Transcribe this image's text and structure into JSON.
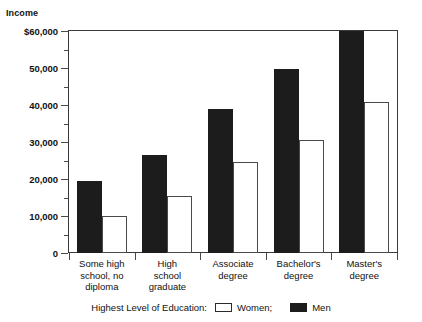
{
  "chart_data": {
    "type": "bar",
    "title": "",
    "xlabel": "Highest Level of Education",
    "ylabel": "Income",
    "ylim": [
      0,
      60000
    ],
    "ytick_labels": [
      "$60,000",
      "50,000",
      "40,000",
      "30,000",
      "20,000",
      "10,000",
      "0"
    ],
    "ytick_values": [
      60000,
      50000,
      40000,
      30000,
      20000,
      10000,
      0
    ],
    "minor_tick_values": [
      55000,
      45000,
      35000,
      25000,
      15000,
      5000
    ],
    "grid": false,
    "legend_position": "bottom",
    "categories": [
      "Some high school, no diploma",
      "High school graduate",
      "Associate degree",
      "Bachelor's degree",
      "Master's degree"
    ],
    "category_lines": [
      [
        "Some high",
        "school, no",
        "diploma"
      ],
      [
        "High",
        "school",
        "graduate"
      ],
      [
        "Associate",
        "degree"
      ],
      [
        "Bachelor's",
        "degree"
      ],
      [
        "Master's",
        "degree"
      ]
    ],
    "series": [
      {
        "name": "Men",
        "color": "#1c1c1c",
        "values": [
          19500,
          26500,
          38800,
          49700,
          60000
        ]
      },
      {
        "name": "Women",
        "color": "#ffffff",
        "values": [
          10000,
          15300,
          24500,
          30500,
          40800
        ]
      }
    ]
  },
  "legend": {
    "title": "Highest Level of Education:",
    "women_label": "Women;",
    "men_label": "Men"
  }
}
